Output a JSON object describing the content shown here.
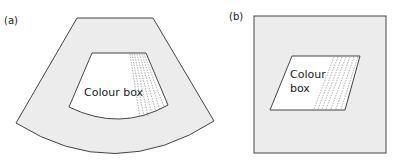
{
  "panels": [
    {
      "id": "a",
      "label": "(a)",
      "shape": "sector",
      "box_label": "Colour box",
      "colors": {
        "field": "#ececec",
        "box": "#ffffff",
        "outline": "#444444",
        "dashes": "#777777"
      }
    },
    {
      "id": "b",
      "label": "(b)",
      "shape": "rectangle",
      "box_label_line1": "Colour",
      "box_label_line2": "box",
      "colors": {
        "field": "#ececec",
        "box": "#ffffff",
        "outline": "#444444",
        "dashes": "#777777"
      }
    }
  ]
}
